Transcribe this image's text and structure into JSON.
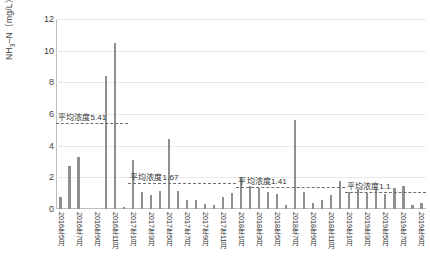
{
  "chart_data": {
    "type": "bar",
    "title": "",
    "xlabel": "",
    "ylabel": "NH₃–N（mg/L）",
    "ylabel_main": "NH",
    "ylabel_sub": "3",
    "ylabel_tail": "–N（mg/L）",
    "ylim": [
      0,
      12
    ],
    "yticks": [
      0,
      2,
      4,
      6,
      8,
      10,
      12
    ],
    "ytick_labels": [
      "0",
      "2",
      "4",
      "6",
      "8",
      "10",
      "12"
    ],
    "grid": true,
    "legend": "none",
    "categories": [
      "2016年5月",
      "2016年6月",
      "2016年7月",
      "2016年8月",
      "2016年9月",
      "2016年10月",
      "2016年11月",
      "2016年12月",
      "2017年1月",
      "2017年2月",
      "2017年3月",
      "2017年4月",
      "2017年5月",
      "2017年6月",
      "2017年7月",
      "2017年8月",
      "2017年9月",
      "2017年10月",
      "2017年11月",
      "2017年12月",
      "2018年1月",
      "2018年2月",
      "2018年3月",
      "2018年4月",
      "2018年5月",
      "2018年6月",
      "2018年7月",
      "2018年8月",
      "2018年9月",
      "2018年10月",
      "2018年11月",
      "2018年12月",
      "2019年1月",
      "2019年2月",
      "2019年3月",
      "2019年4月",
      "2019年5月",
      "2019年6月",
      "2019年7月",
      "2019年8月",
      "2019年9月"
    ],
    "tick_labels_shown": [
      "2016年5月",
      "2016年7月",
      "2016年9月",
      "2016年11月",
      "2017年1月",
      "2017年3月",
      "2017年5月",
      "2017年7月",
      "2017年9月",
      "2017年11月",
      "2018年1月",
      "2018年3月",
      "2018年5月",
      "2018年7月",
      "2018年9月",
      "2018年11月",
      "2019年1月",
      "2019年3月",
      "2019年5月",
      "2019年7月",
      "2019年9月"
    ],
    "values": [
      0.75,
      2.7,
      3.3,
      0.0,
      0.0,
      8.4,
      10.5,
      0.1,
      3.1,
      1.05,
      0.9,
      1.15,
      4.4,
      1.15,
      0.55,
      0.6,
      0.3,
      0.25,
      0.75,
      1.0,
      2.05,
      1.45,
      1.3,
      1.1,
      0.95,
      0.25,
      5.6,
      1.1,
      0.4,
      0.55,
      0.9,
      1.8,
      1.05,
      1.25,
      1.0,
      1.25,
      0.95,
      1.35,
      1.45,
      0.25,
      0.35
    ],
    "bar_color": "#8f8f8f",
    "grid_color": "#e9e9e9",
    "annotations": [
      {
        "label": "平均浓度5.41",
        "value": 5.41,
        "start_index": 0,
        "end_index": 7
      },
      {
        "label": "平均浓度1.67",
        "value": 1.67,
        "start_index": 8,
        "end_index": 19
      },
      {
        "label": "平均浓度1.41",
        "value": 1.41,
        "start_index": 20,
        "end_index": 31
      },
      {
        "label": "平均浓度1.1",
        "value": 1.1,
        "start_index": 32,
        "end_index": 40
      }
    ]
  }
}
